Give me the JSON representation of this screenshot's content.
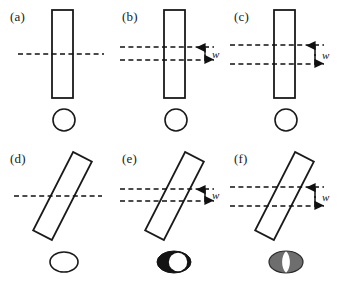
{
  "figure": {
    "rows": 2,
    "columns": 3,
    "background_color": "#ffffff",
    "stroke_color": "#1a1a1a",
    "dash_color": "#111111",
    "gray_fill": "#6e6e6e",
    "black_fill": "#141414",
    "white_fill": "#ffffff"
  },
  "panels": [
    {
      "id": "a",
      "label": "(a)",
      "rect": {
        "tilt_deg": 0,
        "center_x": 62,
        "center_y": 54,
        "width": 21,
        "height": 88
      },
      "scan_lines": {
        "count": 1,
        "y_positions": [
          54
        ],
        "x_start": 18,
        "x_end": 104,
        "gap_w": 0
      },
      "w_annotation": {
        "visible": false,
        "label": "w"
      },
      "spot": {
        "shape": "circle",
        "cx": 64,
        "cy": 120,
        "rx": 11,
        "ry": 11,
        "fill": "#ffffff",
        "inner": "none"
      }
    },
    {
      "id": "b",
      "label": "(b)",
      "rect": {
        "tilt_deg": 0,
        "center_x": 62,
        "center_y": 54,
        "width": 21,
        "height": 88
      },
      "scan_lines": {
        "count": 2,
        "y_positions": [
          47,
          60
        ],
        "x_start": 8,
        "x_end": 102,
        "gap_w": 13
      },
      "w_annotation": {
        "visible": true,
        "label": "w",
        "arrow_x": 93,
        "label_x": 100,
        "label_y": 57
      },
      "spot": {
        "shape": "circle",
        "cx": 64,
        "cy": 120,
        "rx": 11,
        "ry": 11,
        "fill": "#ffffff",
        "inner": "none"
      }
    },
    {
      "id": "c",
      "label": "(c)",
      "rect": {
        "tilt_deg": 0,
        "center_x": 62,
        "center_y": 54,
        "width": 21,
        "height": 88
      },
      "scan_lines": {
        "count": 2,
        "y_positions": [
          45,
          64
        ],
        "x_start": 6,
        "x_end": 100,
        "gap_w": 19
      },
      "w_annotation": {
        "visible": true,
        "label": "w",
        "arrow_x": 91,
        "label_x": 98,
        "label_y": 58
      },
      "spot": {
        "shape": "circle",
        "cx": 62,
        "cy": 120,
        "rx": 11,
        "ry": 11,
        "fill": "#ffffff",
        "inner": "none"
      }
    },
    {
      "id": "d",
      "label": "(d)",
      "rect": {
        "tilt_deg": 27,
        "center_x": 62,
        "center_y": 54,
        "width": 21,
        "height": 88
      },
      "scan_lines": {
        "count": 1,
        "y_positions": [
          54
        ],
        "x_start": 14,
        "x_end": 102,
        "gap_w": 0
      },
      "w_annotation": {
        "visible": false,
        "label": "w"
      },
      "spot": {
        "shape": "ellipse",
        "cx": 64,
        "cy": 120,
        "rx": 14,
        "ry": 10,
        "fill": "#ffffff",
        "inner": "none"
      }
    },
    {
      "id": "e",
      "label": "(e)",
      "rect": {
        "tilt_deg": 27,
        "center_x": 62,
        "center_y": 54,
        "width": 21,
        "height": 88
      },
      "scan_lines": {
        "count": 2,
        "y_positions": [
          47,
          59
        ],
        "x_start": 8,
        "x_end": 102,
        "gap_w": 12
      },
      "w_annotation": {
        "visible": true,
        "label": "w",
        "arrow_x": 93,
        "label_x": 100,
        "label_y": 56
      },
      "spot": {
        "shape": "ellipse",
        "cx": 62,
        "cy": 120,
        "rx": 17,
        "ry": 11,
        "fill": "#141414",
        "inner": "lens-white-offset-right"
      }
    },
    {
      "id": "f",
      "label": "(f)",
      "rect": {
        "tilt_deg": 27,
        "center_x": 62,
        "center_y": 54,
        "width": 21,
        "height": 88
      },
      "scan_lines": {
        "count": 2,
        "y_positions": [
          45,
          64
        ],
        "x_start": 6,
        "x_end": 100,
        "gap_w": 19
      },
      "w_annotation": {
        "visible": true,
        "label": "w",
        "arrow_x": 91,
        "label_x": 98,
        "label_y": 58
      },
      "spot": {
        "shape": "ellipse",
        "cx": 62,
        "cy": 120,
        "rx": 17,
        "ry": 11,
        "fill": "#6e6e6e",
        "inner": "lens-white-center"
      }
    }
  ]
}
